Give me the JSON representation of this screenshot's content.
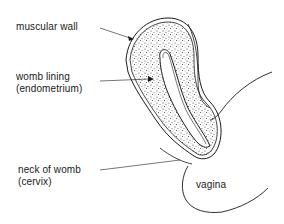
{
  "diagram": {
    "labels": {
      "muscular_wall": "muscular wall",
      "womb_lining_line1": "womb lining",
      "womb_lining_line2": "(endometrium)",
      "neck_of_womb_line1": "neck of womb",
      "neck_of_womb_line2": "(cervix)",
      "vagina": "vagina"
    },
    "colors": {
      "stroke": "#1a1a1a",
      "background": "#ffffff",
      "stipple": "#555555"
    }
  }
}
